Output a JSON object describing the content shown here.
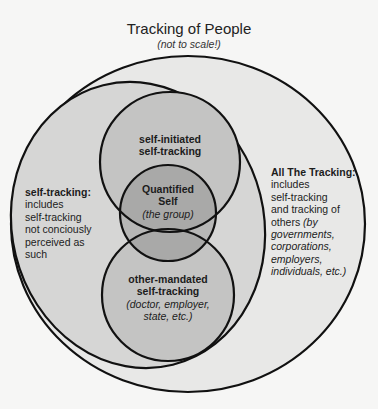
{
  "title": "Tracking of People",
  "subtitle": "(not to scale!)",
  "colors": {
    "background": "#f6f6f5",
    "all_tracking_fill": "#e8e8e7",
    "self_tracking_fill": "#d6d6d5",
    "circle_fill": "#c4c4c3",
    "quantified_self_fill": "#a9a9a8",
    "stroke": "#111111"
  },
  "regions": {
    "all_tracking": {
      "heading": "All The Tracking:",
      "lines": [
        "includes",
        "self-tracking",
        "and tracking of"
      ],
      "mixed_line_plain": "others ",
      "mixed_line_italic": "(by",
      "italic_lines": [
        "governments,",
        "corporations,",
        "employers,",
        "individuals, etc.)"
      ]
    },
    "self_tracking": {
      "heading": "self-tracking:",
      "lines": [
        "includes",
        "self-tracking",
        "not conciously",
        "perceived as",
        "such"
      ]
    },
    "self_initiated": {
      "lines": [
        "self-initiated",
        "self-tracking"
      ]
    },
    "quantified_self": {
      "lines": [
        "Quantified",
        "Self"
      ],
      "note": "(the group)"
    },
    "other_mandated": {
      "lines": [
        "other-mandated",
        "self-tracking"
      ],
      "notes": [
        "(doctor, employer,",
        "state, etc.)"
      ]
    }
  }
}
